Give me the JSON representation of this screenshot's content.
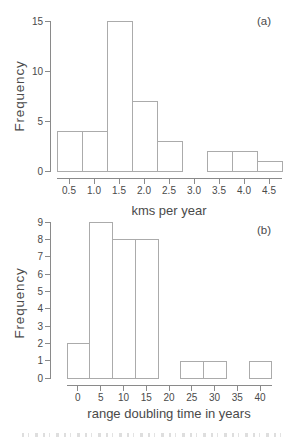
{
  "figure": {
    "panel_labels": [
      "(a)",
      "(b)"
    ]
  },
  "colors": {
    "background": "#ffffff",
    "axis_line": "#8a8a8a",
    "text": "#4a4a4a",
    "bar_fill": "#ffffff",
    "bar_stroke": "#ababab"
  },
  "chart_data": [
    {
      "id": "a",
      "type": "bar",
      "subtype": "histogram",
      "panel_label": "(a)",
      "title": "",
      "xlabel": "kms per year",
      "ylabel": "Frequency",
      "xlim": [
        0.25,
        4.75
      ],
      "ylim": [
        0,
        15
      ],
      "grid": false,
      "legend": null,
      "x_ticks": [
        0.5,
        1.0,
        1.5,
        2.0,
        2.5,
        3.0,
        3.5,
        4.0,
        4.5
      ],
      "x_tick_labels": [
        "0.5",
        "1.0",
        "1.5",
        "2.0",
        "2.5",
        "3.0",
        "3.5",
        "4.0",
        "4.5"
      ],
      "y_ticks": [
        0,
        5,
        10,
        15
      ],
      "y_tick_labels": [
        "0",
        "5",
        "10",
        "15"
      ],
      "bins": [
        {
          "x0": 0.25,
          "x1": 0.75,
          "count": 4
        },
        {
          "x0": 0.75,
          "x1": 1.25,
          "count": 4
        },
        {
          "x0": 1.25,
          "x1": 1.75,
          "count": 15
        },
        {
          "x0": 1.75,
          "x1": 2.25,
          "count": 7
        },
        {
          "x0": 2.25,
          "x1": 2.75,
          "count": 3
        },
        {
          "x0": 2.75,
          "x1": 3.25,
          "count": 0
        },
        {
          "x0": 3.25,
          "x1": 3.75,
          "count": 2
        },
        {
          "x0": 3.75,
          "x1": 4.25,
          "count": 2
        },
        {
          "x0": 4.25,
          "x1": 4.75,
          "count": 1
        }
      ]
    },
    {
      "id": "b",
      "type": "bar",
      "subtype": "histogram",
      "panel_label": "(b)",
      "title": "",
      "xlabel": "range doubling time in years",
      "ylabel": "Frequency",
      "xlim": [
        -2.5,
        42.5
      ],
      "ylim": [
        0,
        9
      ],
      "grid": false,
      "legend": null,
      "x_ticks": [
        0,
        5,
        10,
        15,
        20,
        25,
        30,
        35,
        40
      ],
      "x_tick_labels": [
        "0",
        "5",
        "10",
        "15",
        "20",
        "25",
        "30",
        "35",
        "40"
      ],
      "y_ticks": [
        0,
        1,
        2,
        3,
        4,
        5,
        6,
        7,
        8,
        9
      ],
      "y_tick_labels": [
        "0",
        "1",
        "2",
        "3",
        "4",
        "5",
        "6",
        "7",
        "8",
        "9"
      ],
      "bins": [
        {
          "x0": -2.5,
          "x1": 2.5,
          "count": 2
        },
        {
          "x0": 2.5,
          "x1": 7.5,
          "count": 9
        },
        {
          "x0": 7.5,
          "x1": 12.5,
          "count": 8
        },
        {
          "x0": 12.5,
          "x1": 17.5,
          "count": 8
        },
        {
          "x0": 17.5,
          "x1": 22.5,
          "count": 0
        },
        {
          "x0": 22.5,
          "x1": 27.5,
          "count": 1
        },
        {
          "x0": 27.5,
          "x1": 32.5,
          "count": 1
        },
        {
          "x0": 32.5,
          "x1": 37.5,
          "count": 0
        },
        {
          "x0": 37.5,
          "x1": 42.5,
          "count": 1
        }
      ]
    }
  ]
}
